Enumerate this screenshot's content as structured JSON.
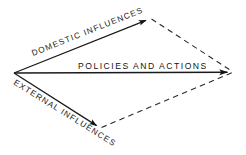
{
  "diagram": {
    "background_color": "#ffffff",
    "stroke_color": "#1a1a1a",
    "text_color": "#1a1a1a",
    "labels": {
      "domestic": "DOMESTIC INFLUENCES",
      "external": "EXTERNAL INFLUENCES",
      "resultant": "POLICIES AND ACTIONS"
    },
    "vectors": [
      {
        "name": "domestic-influences-vector",
        "label": "DOMESTIC INFLUENCES",
        "style": "solid",
        "arrowhead": "filled-triangle",
        "from": [
          14,
          73
        ],
        "to": [
          150,
          18
        ],
        "angle_deg": -22
      },
      {
        "name": "external-influences-vector",
        "label": "EXTERNAL INFLUENCES",
        "style": "solid",
        "arrowhead": "filled-triangle",
        "from": [
          14,
          73
        ],
        "to": [
          100,
          128
        ],
        "angle_deg": 32
      },
      {
        "name": "policies-and-actions-vector",
        "label": "POLICIES AND ACTIONS",
        "style": "solid",
        "arrowhead": "filled-triangle",
        "from": [
          14,
          73
        ],
        "to": [
          233,
          72
        ],
        "angle_deg": 0
      }
    ],
    "construction_lines": [
      {
        "name": "upper-dashed-construction-line",
        "style": "dashed",
        "from": [
          150,
          18
        ],
        "to": [
          233,
          72
        ]
      },
      {
        "name": "lower-dashed-construction-line",
        "style": "dashed",
        "from": [
          100,
          128
        ],
        "to": [
          233,
          72
        ]
      }
    ],
    "vertices": [
      {
        "name": "origin-vertex",
        "x": 14,
        "y": 73
      },
      {
        "name": "top-vertex",
        "x": 150,
        "y": 18
      },
      {
        "name": "bottom-vertex",
        "x": 100,
        "y": 128
      },
      {
        "name": "right-vertex",
        "x": 233,
        "y": 72
      }
    ]
  }
}
